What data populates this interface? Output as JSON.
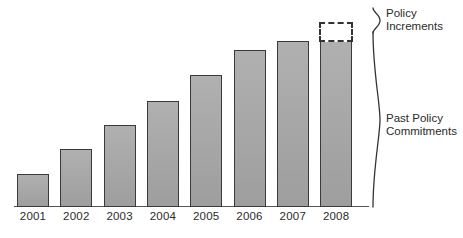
{
  "chart_data": {
    "type": "bar",
    "title": "",
    "subtitle": "",
    "xlabel": "",
    "ylabel": "",
    "categories": [
      "2001",
      "2002",
      "2003",
      "2004",
      "2005",
      "2006",
      "2007",
      "2008"
    ],
    "series": [
      {
        "name": "Past Policy Commitments",
        "values": [
          18,
          32,
          46,
          59,
          74,
          88,
          93,
          93
        ]
      },
      {
        "name": "Policy Increments",
        "values": [
          0,
          0,
          0,
          0,
          0,
          0,
          0,
          11
        ]
      }
    ],
    "values": [
      18,
      32,
      46,
      59,
      74,
      88,
      93,
      93
    ],
    "ylim": [
      0,
      110
    ],
    "grid": false,
    "legend_position": "right",
    "annotations": [
      {
        "name": "policy-increments",
        "text": "Policy Increments",
        "lines": [
          "Policy",
          "Increments"
        ],
        "style": "dashed-outline",
        "applies_to": "2008"
      },
      {
        "name": "past-policy-commitments",
        "text": "Past Policy Commitments",
        "lines": [
          "Past Policy",
          "Commitments"
        ],
        "style": "solid-fill",
        "applies_to": "all-years"
      }
    ],
    "colors": {
      "bar_fill": "#a8a8a8",
      "bar_border": "#3a3a3a",
      "dashed_border": "#333333",
      "axis": "#555555",
      "text": "#2b2b2b",
      "background": "#ffffff"
    }
  },
  "braces": [
    {
      "name": "policy-increments-brace",
      "label_lines": [
        "Policy",
        "Increments"
      ]
    },
    {
      "name": "past-policy-commitments-brace",
      "label_lines": [
        "Past Policy",
        "Commitments"
      ]
    }
  ],
  "caption": {
    "clipped_text": ""
  }
}
